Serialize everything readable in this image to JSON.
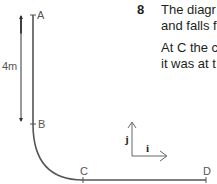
{
  "question": {
    "number": "8",
    "lines": [
      "The diagr",
      "and falls f",
      "At C the c",
      "it was at t"
    ]
  },
  "diagram": {
    "points": [
      "A",
      "B",
      "C",
      "D"
    ],
    "height_label": "4m",
    "unit_vectors": {
      "i": "i",
      "j": "j"
    }
  }
}
